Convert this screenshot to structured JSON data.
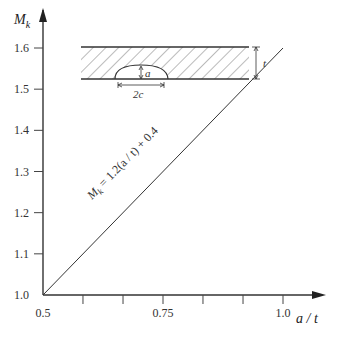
{
  "chart_data": {
    "type": "line",
    "title": "",
    "xlabel": "a / t",
    "ylabel_main": "M",
    "ylabel_sub": "k",
    "xlim": [
      0.5,
      1.05
    ],
    "ylim": [
      1.0,
      1.65
    ],
    "x_ticks": [
      0.5,
      0.5833,
      0.6667,
      0.75,
      0.8333,
      0.9167,
      1.0
    ],
    "x_tick_labels": [
      {
        "value": 0.5,
        "label": "0.5"
      },
      {
        "value": 0.75,
        "label": "0.75"
      },
      {
        "value": 1.0,
        "label": "1.0"
      }
    ],
    "y_ticks": [
      1.1,
      1.2,
      1.3,
      1.4,
      1.5,
      1.6
    ],
    "y_tick_labels": [
      {
        "value": 1.0,
        "label": "1.0"
      },
      {
        "value": 1.1,
        "label": "1.1"
      },
      {
        "value": 1.2,
        "label": "1.2"
      },
      {
        "value": 1.3,
        "label": "1.3"
      },
      {
        "value": 1.4,
        "label": "1.4"
      },
      {
        "value": 1.5,
        "label": "1.5"
      },
      {
        "value": 1.6,
        "label": "1.6"
      }
    ],
    "grid": false,
    "series": [
      {
        "name": "M_k = 1.2(a/t) + 0.4",
        "x": [
          0.5,
          1.0
        ],
        "y": [
          1.0,
          1.6
        ]
      }
    ],
    "annotations": [
      {
        "text_main": "M",
        "text_sub": "k",
        "text_rest": " = 1.2(a / t) + 0.4",
        "along_series": 0
      }
    ],
    "inset": {
      "description": "plate cross-section with semi-elliptical surface crack",
      "label_depth": "a",
      "label_width": "2c",
      "label_thickness": "t"
    }
  }
}
